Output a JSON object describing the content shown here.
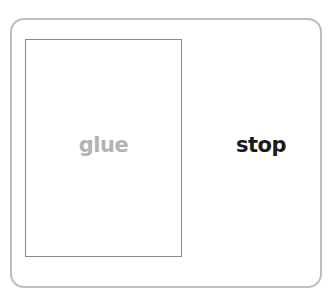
{
  "card": {
    "drop_slot": {
      "word": "glue",
      "word_color": "#b3b3b3"
    },
    "option": {
      "word": "stop",
      "word_color": "#1a1a1a"
    }
  },
  "colors": {
    "card_border": "#bdbdbd",
    "slot_border": "#8a8a8a",
    "background": "#ffffff"
  }
}
